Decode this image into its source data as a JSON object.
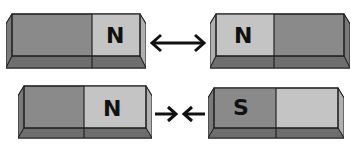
{
  "colors": {
    "dark_half": "#8a8a8a",
    "light_half": "#c4c4c4",
    "bottom_face": "#6e6e6e",
    "outline": "#222222"
  },
  "rows": [
    {
      "relation": "repel",
      "arrow_glyph": "double-headed-arrow",
      "left_magnet": {
        "label": "N",
        "label_side": "right"
      },
      "right_magnet": {
        "label": "N",
        "label_side": "left"
      }
    },
    {
      "relation": "attract",
      "arrow_glyph": "converging-arrows",
      "left_magnet": {
        "label": "N",
        "label_side": "right"
      },
      "right_magnet": {
        "label": "S",
        "label_side": "left"
      }
    }
  ]
}
